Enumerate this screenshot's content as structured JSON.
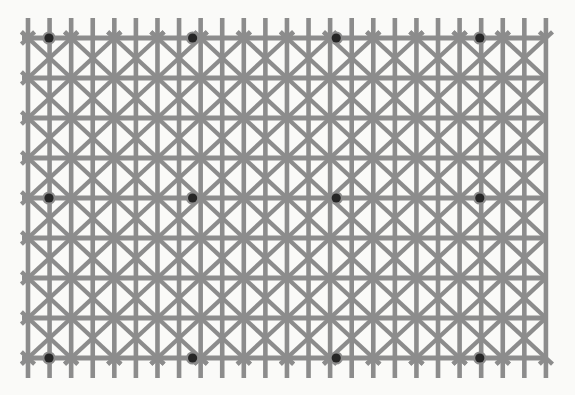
{
  "figure": {
    "name": "Ninio's extinction illusion",
    "canvas": {
      "width": 575,
      "height": 395,
      "background": "#ffffff"
    },
    "colors": {
      "background": "#ffffff",
      "panel": "#fafaf8",
      "line": "#8c8c8c",
      "dot": "#262626"
    },
    "grid": {
      "x_start": 28,
      "x_end": 546,
      "y_start": 18,
      "y_end": 378,
      "v_spacing": 21.58,
      "h_spacing": 40,
      "v_line_count": 25,
      "h_line_count": 9,
      "h_line_y": [
        38,
        78,
        118,
        158,
        198,
        238,
        278,
        318,
        358
      ],
      "h_line_width": 5.2,
      "v_line_width": 4.6,
      "diagonal_width": 4.4,
      "diagonal_cell_cols": 2,
      "diagonal_cell_rows": 1
    },
    "dots": {
      "radius": 4.6,
      "halo_radius": 6.6,
      "columns_x": [
        49,
        192.6,
        336.2,
        479.8
      ],
      "rows_y": [
        38,
        198,
        358
      ],
      "count": 12,
      "color": "#262626"
    }
  }
}
